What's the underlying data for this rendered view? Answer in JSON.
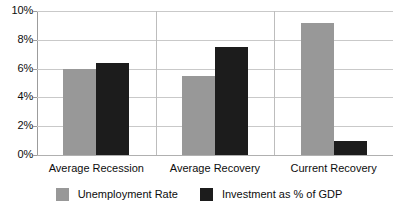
{
  "chart_data": {
    "type": "bar",
    "title": "",
    "subtitle": "",
    "xlabel": "",
    "ylabel": "",
    "categories": [
      "Average Recession",
      "Average Recovery",
      "Current Recovery"
    ],
    "series": [
      {
        "name": "Unemployment Rate",
        "color": "#989898",
        "values": [
          6.0,
          5.5,
          9.2
        ]
      },
      {
        "name": "Investment as % of GDP",
        "color": "#1c1c1c",
        "values": [
          6.4,
          7.5,
          1.0
        ]
      }
    ],
    "ylim": [
      0,
      10
    ],
    "ytick_values": [
      0,
      2,
      4,
      6,
      8,
      10
    ],
    "ytick_labels": [
      "0%",
      "2%",
      "4%",
      "6%",
      "8%",
      "10%"
    ],
    "grid": true,
    "grid_axis": "y",
    "legend": {
      "position": "bottom",
      "entries": [
        {
          "label": "Unemployment Rate",
          "color": "#989898"
        },
        {
          "label": "Investment as % of GDP",
          "color": "#1c1c1c"
        }
      ]
    },
    "axis_color": "#9c9c9c",
    "grid_color": "#c9c9c9",
    "background": "#ffffff"
  }
}
